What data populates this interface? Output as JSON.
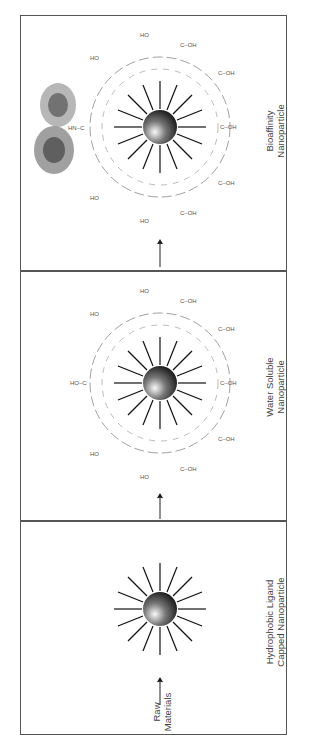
{
  "figure": {
    "orientation": "rotated-90-ccw",
    "stages": [
      {
        "id": "raw",
        "label_line1": "Raw",
        "label_line2": "Materials"
      },
      {
        "id": "hydrophobic",
        "label_line1": "Hydrophobic Ligand",
        "label_line2": "Capped Nanoparticle"
      },
      {
        "id": "water-soluble",
        "label_line1": "Water Soluble",
        "label_line2": "Nanoparticle"
      },
      {
        "id": "bioaffinity",
        "label_line1": "Bioaffinity",
        "label_line2": "Nanoparticle"
      }
    ],
    "chem": {
      "phosphine_oxide": "O=P",
      "carboxyl": "C-OH",
      "amide": "HN-C",
      "hydroxyl": "HO"
    },
    "colors": {
      "frame": "#555555",
      "polymer": "#777777",
      "ligand": "#111111",
      "text": "#444444"
    }
  }
}
